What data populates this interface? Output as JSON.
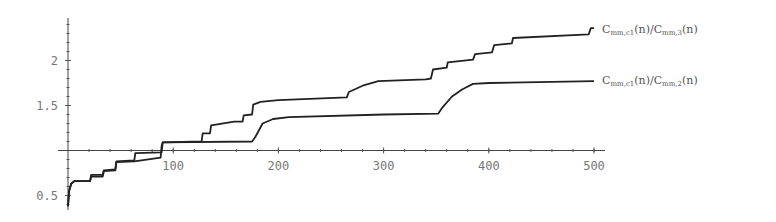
{
  "chart_data": {
    "type": "line",
    "title": "",
    "xlabel": "",
    "ylabel": "",
    "xlim": [
      0,
      510
    ],
    "ylim": [
      0.38,
      2.4
    ],
    "axes_origin": {
      "x": 0,
      "y": 1.0
    },
    "grid": false,
    "x_ticks": [
      100,
      200,
      300,
      400,
      500
    ],
    "x_tick_labels": [
      "100",
      "200",
      "300",
      "400",
      "500"
    ],
    "y_ticks": [
      0.5,
      1.5,
      2
    ],
    "y_tick_labels": [
      "0.5",
      "1.5",
      "2"
    ],
    "legend_position": "inline-right",
    "series": [
      {
        "name": "C_mm,c1(n)/C_mm,3(n)",
        "label_main": "C",
        "label_sub1": "mm,c1",
        "label_mid": "(n)/C",
        "label_sub2": "mm,3",
        "label_end": "(n)",
        "x": [
          0,
          1,
          3,
          6,
          21,
          22,
          33,
          34,
          45,
          46,
          63,
          64,
          89,
          90,
          127,
          128,
          135,
          136,
          158,
          166,
          167,
          175,
          176,
          183,
          200,
          265,
          267,
          280,
          295,
          340,
          345,
          347,
          360,
          361,
          385,
          387,
          403,
          405,
          422,
          423,
          495,
          497,
          500
        ],
        "y": [
          0.38,
          0.55,
          0.63,
          0.66,
          0.66,
          0.73,
          0.73,
          0.78,
          0.79,
          0.88,
          0.89,
          0.97,
          0.98,
          1.09,
          1.1,
          1.19,
          1.19,
          1.28,
          1.32,
          1.32,
          1.39,
          1.4,
          1.51,
          1.54,
          1.56,
          1.59,
          1.65,
          1.72,
          1.77,
          1.79,
          1.8,
          1.9,
          1.92,
          1.98,
          2.01,
          2.07,
          2.09,
          2.17,
          2.19,
          2.25,
          2.29,
          2.36,
          2.36
        ]
      },
      {
        "name": "C_mm,c1(n)/C_mm,2(n)",
        "label_main": "C",
        "label_sub1": "mm,c1",
        "label_mid": "(n)/C",
        "label_sub2": "mm,2",
        "label_end": "(n)",
        "x": [
          0,
          1,
          3,
          6,
          21,
          22,
          33,
          34,
          45,
          46,
          63,
          88,
          89,
          90,
          175,
          178,
          185,
          195,
          210,
          300,
          352,
          356,
          365,
          375,
          385,
          400,
          500
        ],
        "y": [
          0.38,
          0.55,
          0.63,
          0.66,
          0.66,
          0.71,
          0.71,
          0.77,
          0.78,
          0.87,
          0.88,
          0.92,
          1.05,
          1.09,
          1.1,
          1.15,
          1.3,
          1.35,
          1.37,
          1.4,
          1.41,
          1.48,
          1.6,
          1.68,
          1.74,
          1.75,
          1.77
        ]
      }
    ]
  }
}
